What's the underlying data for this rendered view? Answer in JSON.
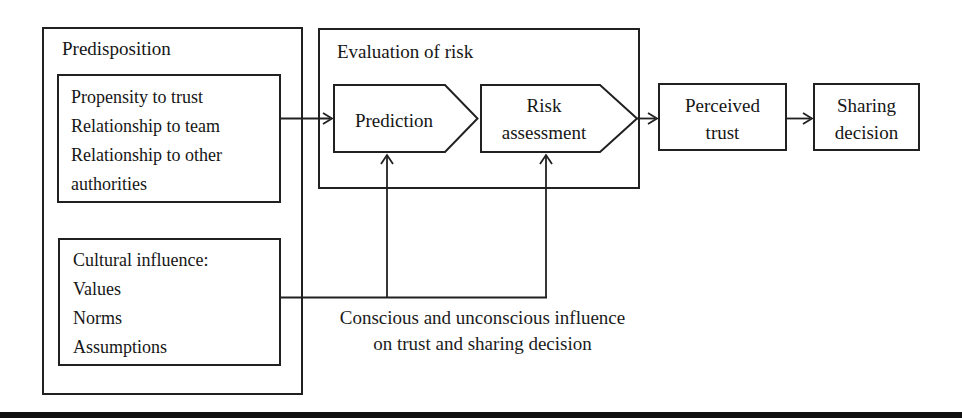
{
  "figure": {
    "predisposition": {
      "title": "Predisposition",
      "factors_lines": [
        "Propensity to trust",
        "Relationship to team",
        "Relationship to other",
        "authorities"
      ],
      "culture_lines": [
        "Cultural influence:",
        "Values",
        "Norms",
        "Assumptions"
      ]
    },
    "evaluation_of_risk": {
      "title": "Evaluation of risk",
      "prediction": "Prediction",
      "risk_assessment_lines": [
        "Risk",
        "assessment"
      ]
    },
    "perceived_trust_lines": [
      "Perceived",
      "trust"
    ],
    "sharing_decision_lines": [
      "Sharing",
      "decision"
    ],
    "influence_caption_lines": [
      "Conscious and unconscious influence",
      "on trust and sharing decision"
    ],
    "colors": {
      "line": "#212121",
      "text": "#161616",
      "background": "#ffffff",
      "bottom_bar": "#101010"
    }
  }
}
